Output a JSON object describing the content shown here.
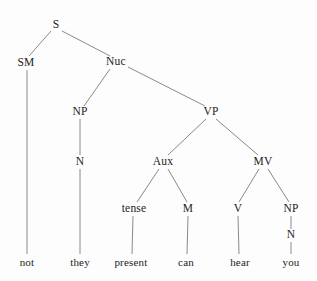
{
  "diagram": {
    "type": "syntax-tree",
    "sentence": "not they present can hear you",
    "style": {
      "background_color": "#fdfdfd",
      "line_color": "#8a8a8a",
      "text_color": "#1c1c1c",
      "line_width": 1
    },
    "nodes": [
      {
        "id": "S",
        "label": "S",
        "x": 56,
        "y": 25,
        "kind": "nonterminal"
      },
      {
        "id": "SM",
        "label": "SM",
        "x": 26,
        "y": 63,
        "kind": "nonterminal"
      },
      {
        "id": "Nuc",
        "label": "Nuc",
        "x": 116,
        "y": 62,
        "kind": "nonterminal"
      },
      {
        "id": "NP1",
        "label": "NP",
        "x": 80,
        "y": 112,
        "kind": "nonterminal"
      },
      {
        "id": "VP",
        "label": "VP",
        "x": 211,
        "y": 112,
        "kind": "nonterminal"
      },
      {
        "id": "N1",
        "label": "N",
        "x": 80,
        "y": 162,
        "kind": "nonterminal"
      },
      {
        "id": "Aux",
        "label": "Aux",
        "x": 163,
        "y": 162,
        "kind": "nonterminal"
      },
      {
        "id": "MV",
        "label": "MV",
        "x": 263,
        "y": 162,
        "kind": "nonterminal"
      },
      {
        "id": "tense",
        "label": "tense",
        "x": 134,
        "y": 209,
        "kind": "nonterminal"
      },
      {
        "id": "M",
        "label": "M",
        "x": 188,
        "y": 209,
        "kind": "nonterminal"
      },
      {
        "id": "V",
        "label": "V",
        "x": 238,
        "y": 209,
        "kind": "nonterminal"
      },
      {
        "id": "NP2",
        "label": "NP",
        "x": 291,
        "y": 209,
        "kind": "nonterminal"
      },
      {
        "id": "N2",
        "label": "N",
        "x": 291,
        "y": 235,
        "kind": "nonterminal"
      },
      {
        "id": "not",
        "label": "not",
        "x": 27,
        "y": 262,
        "kind": "terminal"
      },
      {
        "id": "they",
        "label": "they",
        "x": 80,
        "y": 262,
        "kind": "terminal"
      },
      {
        "id": "present",
        "label": "present",
        "x": 131,
        "y": 262,
        "kind": "terminal"
      },
      {
        "id": "can",
        "label": "can",
        "x": 186,
        "y": 262,
        "kind": "terminal"
      },
      {
        "id": "hear",
        "label": "hear",
        "x": 240,
        "y": 262,
        "kind": "terminal"
      },
      {
        "id": "you",
        "label": "you",
        "x": 291,
        "y": 262,
        "kind": "terminal"
      }
    ],
    "edges": [
      {
        "from": "S",
        "to": "SM",
        "x1": 51,
        "y1": 31,
        "x2": 29,
        "y2": 56
      },
      {
        "from": "S",
        "to": "Nuc",
        "x1": 62,
        "y1": 31,
        "x2": 110,
        "y2": 56
      },
      {
        "from": "SM",
        "to": "not",
        "x1": 27,
        "y1": 70,
        "x2": 27,
        "y2": 254
      },
      {
        "from": "Nuc",
        "to": "NP1",
        "x1": 110,
        "y1": 69,
        "x2": 84,
        "y2": 106
      },
      {
        "from": "Nuc",
        "to": "VP",
        "x1": 128,
        "y1": 67,
        "x2": 205,
        "y2": 106
      },
      {
        "from": "NP1",
        "to": "N1",
        "x1": 80,
        "y1": 119,
        "x2": 80,
        "y2": 155
      },
      {
        "from": "N1",
        "to": "they",
        "x1": 80,
        "y1": 169,
        "x2": 80,
        "y2": 254
      },
      {
        "from": "VP",
        "to": "Aux",
        "x1": 206,
        "y1": 119,
        "x2": 168,
        "y2": 155
      },
      {
        "from": "VP",
        "to": "MV",
        "x1": 216,
        "y1": 119,
        "x2": 258,
        "y2": 155
      },
      {
        "from": "Aux",
        "to": "tense",
        "x1": 159,
        "y1": 169,
        "x2": 137,
        "y2": 202
      },
      {
        "from": "Aux",
        "to": "M",
        "x1": 168,
        "y1": 169,
        "x2": 187,
        "y2": 202
      },
      {
        "from": "MV",
        "to": "V",
        "x1": 259,
        "y1": 169,
        "x2": 239,
        "y2": 202
      },
      {
        "from": "MV",
        "to": "NP2",
        "x1": 268,
        "y1": 169,
        "x2": 289,
        "y2": 202
      },
      {
        "from": "tense",
        "to": "present",
        "x1": 133,
        "y1": 216,
        "x2": 132,
        "y2": 254
      },
      {
        "from": "M",
        "to": "can",
        "x1": 188,
        "y1": 216,
        "x2": 187,
        "y2": 254
      },
      {
        "from": "V",
        "to": "hear",
        "x1": 238,
        "y1": 216,
        "x2": 239,
        "y2": 254
      },
      {
        "from": "NP2",
        "to": "N2",
        "x1": 291,
        "y1": 216,
        "x2": 291,
        "y2": 229
      },
      {
        "from": "N2",
        "to": "you",
        "x1": 291,
        "y1": 242,
        "x2": 291,
        "y2": 254
      }
    ]
  }
}
